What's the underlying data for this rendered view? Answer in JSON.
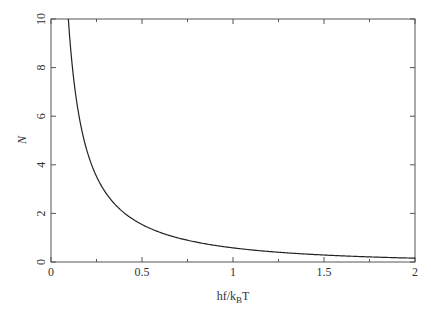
{
  "chart_data": {
    "type": "line",
    "title": "",
    "xlabel": "hf/k_B T",
    "xlabel_parts": {
      "main": "hf/k",
      "sub": "B",
      "tail": "T"
    },
    "ylabel": "N",
    "xlim": [
      0,
      2
    ],
    "ylim": [
      0,
      10
    ],
    "x_ticks": [
      0,
      0.5,
      1,
      1.5,
      2
    ],
    "x_tick_labels": [
      "0",
      "0.5",
      "1",
      "1.5",
      "2"
    ],
    "y_ticks": [
      0,
      2,
      4,
      6,
      8,
      10
    ],
    "y_tick_labels": [
      "0",
      "2",
      "4",
      "6",
      "8",
      "10"
    ],
    "grid": false,
    "legend": null,
    "series": [
      {
        "name": "N = 1/(exp(hf/k_B T) - 1)",
        "x": [
          0.0953,
          0.1,
          0.125,
          0.15,
          0.175,
          0.2,
          0.25,
          0.3,
          0.35,
          0.4,
          0.45,
          0.5,
          0.6,
          0.7,
          0.8,
          0.9,
          1.0,
          1.2,
          1.4,
          1.6,
          1.8,
          2.0
        ],
        "values": [
          10.0,
          9.51,
          7.51,
          6.17,
          5.23,
          4.52,
          3.52,
          2.86,
          2.38,
          2.03,
          1.76,
          1.54,
          1.22,
          0.99,
          0.816,
          0.686,
          0.582,
          0.431,
          0.326,
          0.253,
          0.198,
          0.157
        ]
      }
    ]
  }
}
